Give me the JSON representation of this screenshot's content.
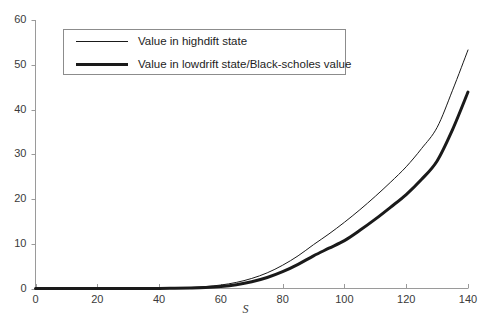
{
  "chart_data": {
    "type": "line",
    "title": "",
    "subtitle": "",
    "xlabel": "S",
    "ylabel": "",
    "xlim": [
      0,
      140
    ],
    "ylim": [
      0,
      60
    ],
    "grid": false,
    "legend_position": "upper-left-inside",
    "xticks": [
      0,
      20,
      40,
      60,
      80,
      100,
      120,
      140
    ],
    "xtick_labels": [
      "0",
      "20",
      "40",
      "60",
      "80",
      "100",
      "120",
      "140"
    ],
    "yticks": [
      0,
      10,
      20,
      30,
      40,
      50,
      60
    ],
    "ytick_labels": [
      "0",
      "10",
      "20",
      "30",
      "40",
      "50",
      "60"
    ],
    "x": [
      0,
      10,
      20,
      30,
      40,
      45,
      50,
      55,
      60,
      65,
      70,
      75,
      80,
      85,
      90,
      95,
      100,
      105,
      110,
      115,
      120,
      125,
      130,
      135,
      140
    ],
    "series": [
      {
        "name": "Value in highdift state",
        "color": "#1a1a1a",
        "line_width": 1,
        "values": [
          0,
          0,
          0,
          0.01,
          0.05,
          0.11,
          0.22,
          0.42,
          0.78,
          1.36,
          2.25,
          3.5,
          5.2,
          7.3,
          9.8,
          12.2,
          14.8,
          17.6,
          20.6,
          23.8,
          27.2,
          31.3,
          36.0,
          44.3,
          53.3
        ]
      },
      {
        "name": "Value in lowdrift state/Black-scholes value",
        "color": "#1a1a1a",
        "line_width": 3,
        "values": [
          0,
          0,
          0,
          0,
          0.02,
          0.05,
          0.11,
          0.22,
          0.45,
          0.85,
          1.5,
          2.45,
          3.75,
          5.4,
          7.3,
          9.0,
          10.7,
          13.0,
          15.5,
          18.2,
          21.0,
          24.4,
          28.5,
          35.5,
          43.9
        ]
      }
    ],
    "legend_entries": [
      {
        "label": "Value in highdift state",
        "style": "thin"
      },
      {
        "label": "Value in lowdrift state/Black-scholes value",
        "style": "thick"
      }
    ],
    "axis_color": "#9a9a9a",
    "text_color": "#3a3a3a"
  }
}
